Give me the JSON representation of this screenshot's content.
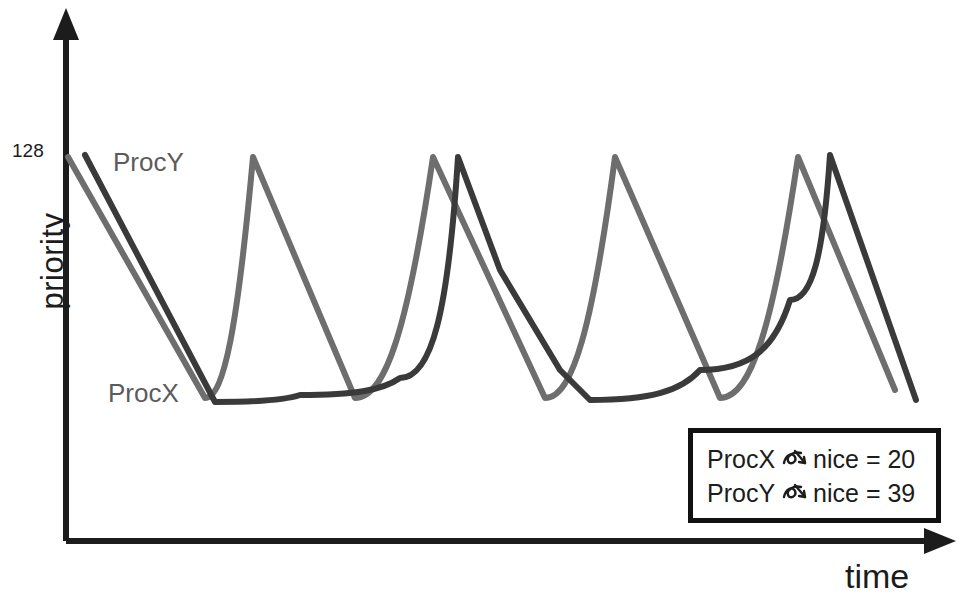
{
  "figure": {
    "axes": {
      "y_label": "priority",
      "y_top_tick": "128",
      "x_label": "time"
    },
    "series_labels": {
      "procy": "ProcY",
      "procx": "ProcX"
    },
    "legend": {
      "arrow_icon": "implies-arrow-icon",
      "rows": [
        {
          "process": "ProcX",
          "relation": "nice = 20"
        },
        {
          "process": "ProcY",
          "relation": "nice = 39"
        }
      ]
    },
    "colors": {
      "axis": "#1c1c1c",
      "procx": "#3a3a3a",
      "procy": "#6e6e6e",
      "legend_border": "#111111",
      "background": "#ffffff"
    }
  },
  "chart_data": {
    "type": "line",
    "title": "",
    "xlabel": "time",
    "ylabel": "priority",
    "xlim": [
      66,
      950
    ],
    "ylim": [
      541,
      155
    ],
    "y_ticks": [
      {
        "value": 128,
        "label": "128",
        "pixel_y": 155
      }
    ],
    "grid": false,
    "legend_position": "bottom-right",
    "axis_origin_px": {
      "x": 66,
      "y": 541
    },
    "series": [
      {
        "name": "ProcX",
        "nice": 20,
        "color": "#3a3a3a",
        "stroke_width": 6,
        "peaks_px_x": [
          85,
          458,
          830
        ],
        "troughs_px_x": [
          215,
          590
        ],
        "top_px_y": 155,
        "bottom_px_y": 402,
        "points": [
          [
            85,
            155
          ],
          [
            215,
            402
          ],
          [
            300,
            395
          ],
          [
            400,
            378
          ],
          [
            458,
            157
          ],
          [
            500,
            270
          ],
          [
            560,
            370
          ],
          [
            590,
            400
          ],
          [
            700,
            370
          ],
          [
            790,
            300
          ],
          [
            830,
            155
          ],
          [
            916,
            400
          ]
        ]
      },
      {
        "name": "ProcY",
        "nice": 39,
        "color": "#6e6e6e",
        "stroke_width": 6,
        "peaks_px_x": [
          68,
          253,
          433,
          615,
          798
        ],
        "troughs_px_x": [
          205,
          355,
          545,
          720
        ],
        "top_px_y": 157,
        "bottom_px_y": 398,
        "points": [
          [
            68,
            157
          ],
          [
            205,
            398
          ],
          [
            253,
            157
          ],
          [
            355,
            398
          ],
          [
            433,
            157
          ],
          [
            545,
            398
          ],
          [
            615,
            157
          ],
          [
            720,
            398
          ],
          [
            798,
            157
          ],
          [
            895,
            390
          ]
        ]
      }
    ]
  }
}
